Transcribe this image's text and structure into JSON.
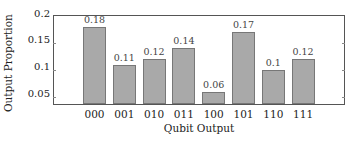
{
  "chart_data": {
    "type": "bar",
    "title": "",
    "xlabel": "Qubit Output",
    "ylabel": "Output Proportion",
    "categories": [
      "000",
      "001",
      "010",
      "011",
      "100",
      "101",
      "110",
      "111"
    ],
    "values": [
      0.18,
      0.11,
      0.12,
      0.14,
      0.06,
      0.17,
      0.1,
      0.12
    ],
    "value_labels": [
      "0.18",
      "0.11",
      "0.12",
      "0.14",
      "0.06",
      "0.17",
      "0.1",
      "0.12"
    ],
    "yticks": [
      "0.05",
      "0.1",
      "0.15",
      "0.2"
    ],
    "ylim": [
      0.035,
      0.2
    ],
    "grid": false,
    "legend": null,
    "bar_color": "#a9a9a9"
  }
}
